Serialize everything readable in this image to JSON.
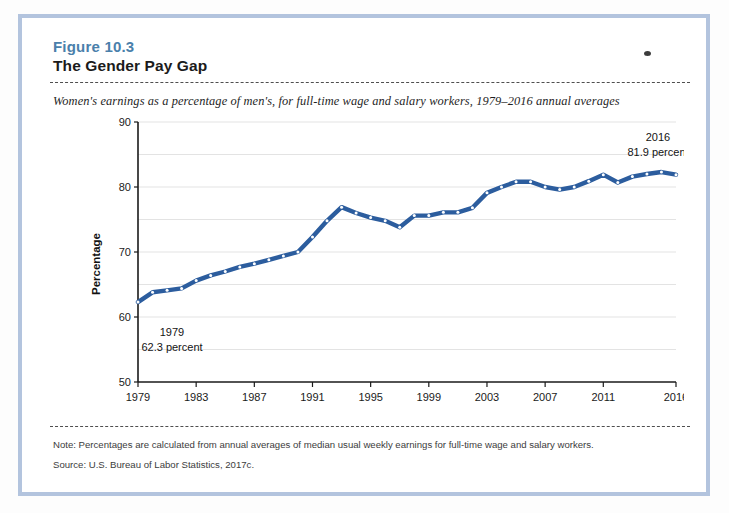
{
  "figure": {
    "label": "Figure 10.3",
    "title": "The Gender Pay Gap",
    "subtitle": "Women's earnings as a percentage of men's, for full-time wage and salary workers, 1979–2016 annual averages",
    "note": "Note: Percentages are calculated from annual averages of median usual weekly earnings for full-time wage and salary workers.",
    "source": "Source: U.S. Bureau of Labor Statistics, 2017c."
  },
  "colors": {
    "line": "#2c5d9e",
    "figure_label": "#4a80ab",
    "title": "#1b1b1b",
    "frame": "#b3c4de",
    "gridline": "#e3e3e3",
    "axis": "#1a1a1a"
  },
  "annotations": [
    {
      "name": "start-callout",
      "line1": "1979",
      "line2": "62.3 percent",
      "year": 1979,
      "value": 62.3
    },
    {
      "name": "end-callout",
      "line1": "2016",
      "line2": "81.9 percent",
      "year": 2016,
      "value": 81.9
    }
  ],
  "chart_data": {
    "type": "line",
    "title": "The Gender Pay Gap",
    "subtitle": "Women's earnings as a percentage of men's, for full-time wage and salary workers, 1979–2016 annual averages",
    "xlabel": "",
    "ylabel": "Percentage",
    "ylim": [
      50,
      90
    ],
    "xlim": [
      1979,
      2016
    ],
    "y_major_ticks": [
      50,
      60,
      70,
      80,
      90
    ],
    "y_minor_gridlines": [
      55,
      65,
      75,
      85
    ],
    "x_tick_labels": [
      "1979",
      "1983",
      "1987",
      "1991",
      "1995",
      "1999",
      "2003",
      "2007",
      "2011",
      "2016"
    ],
    "x_tick_values": [
      1979,
      1983,
      1987,
      1991,
      1995,
      1999,
      2003,
      2007,
      2011,
      2016
    ],
    "grid": true,
    "legend": false,
    "series": [
      {
        "name": "Women's earnings as a percentage of men's",
        "color": "#2c5d9e",
        "x": [
          1979,
          1980,
          1981,
          1982,
          1983,
          1984,
          1985,
          1986,
          1987,
          1988,
          1989,
          1990,
          1991,
          1992,
          1993,
          1994,
          1995,
          1996,
          1997,
          1998,
          1999,
          2000,
          2001,
          2002,
          2003,
          2004,
          2005,
          2006,
          2007,
          2008,
          2009,
          2010,
          2011,
          2012,
          2013,
          2014,
          2015,
          2016
        ],
        "values": [
          62.3,
          63.8,
          64.1,
          64.4,
          65.6,
          66.4,
          67.0,
          67.7,
          68.2,
          68.8,
          69.4,
          70.0,
          72.3,
          74.8,
          76.9,
          76.0,
          75.3,
          74.8,
          73.8,
          75.6,
          75.6,
          76.1,
          76.1,
          76.8,
          79.1,
          80.0,
          80.8,
          80.8,
          80.0,
          79.6,
          80.0,
          80.9,
          81.9,
          80.7,
          81.6,
          82.0,
          82.3,
          81.9
        ]
      }
    ]
  }
}
